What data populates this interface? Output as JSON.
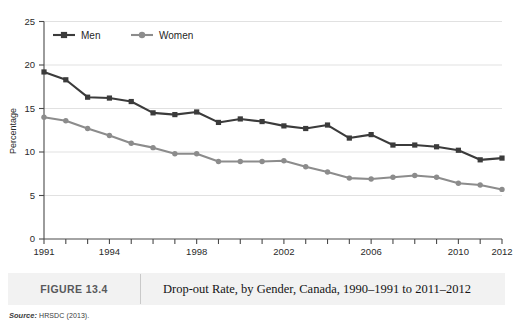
{
  "figure": {
    "number_label": "FIGURE 13.4",
    "caption": "Drop-out Rate, by Gender, Canada, 1990–1991 to 2011–2012",
    "source_label": "Source:",
    "source_value": "HRSDC (2013)."
  },
  "chart_data": {
    "type": "line",
    "title": "",
    "xlabel": "",
    "ylabel": "Percentage",
    "ylim": [
      0,
      25
    ],
    "yticks": [
      0,
      5,
      10,
      15,
      20,
      25
    ],
    "ytick_labels": [
      "0",
      "5",
      "10",
      "15",
      "20",
      "25"
    ],
    "grid": true,
    "legend_position": "top-left",
    "xlim": [
      1991,
      2012
    ],
    "x": [
      1991,
      1992,
      1993,
      1994,
      1995,
      1996,
      1997,
      1998,
      1999,
      2000,
      2001,
      2002,
      2003,
      2004,
      2005,
      2006,
      2007,
      2008,
      2009,
      2010,
      2011,
      2012
    ],
    "xticks": [
      1991,
      1992,
      1993,
      1994,
      1995,
      1996,
      1997,
      1998,
      1999,
      2000,
      2001,
      2002,
      2003,
      2004,
      2005,
      2006,
      2007,
      2008,
      2009,
      2010,
      2011,
      2012
    ],
    "xtick_labels": [
      "1991",
      "",
      "",
      "1994",
      "",
      "",
      "",
      "1998",
      "",
      "",
      "",
      "2002",
      "",
      "",
      "",
      "2006",
      "",
      "",
      "",
      "2010",
      "",
      "2012"
    ],
    "series": [
      {
        "name": "Men",
        "color": "#3b3b3b",
        "marker": "square",
        "values": [
          19.2,
          18.3,
          16.3,
          16.2,
          15.8,
          14.5,
          14.3,
          14.6,
          13.4,
          13.8,
          13.5,
          13.0,
          12.7,
          13.1,
          11.6,
          12.0,
          10.8,
          10.8,
          10.6,
          10.2,
          9.1,
          9.3
        ]
      },
      {
        "name": "Women",
        "color": "#8c8c8c",
        "marker": "circle",
        "values": [
          14.0,
          13.6,
          12.7,
          11.9,
          11.0,
          10.5,
          9.8,
          9.8,
          8.9,
          8.9,
          8.9,
          9.0,
          8.3,
          7.7,
          7.0,
          6.9,
          7.1,
          7.3,
          7.1,
          6.4,
          6.2,
          5.7
        ]
      }
    ]
  }
}
